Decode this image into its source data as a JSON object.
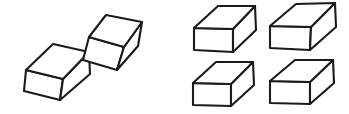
{
  "figure": {
    "background_color": "#ffffff",
    "line_color": "#1a1a1a",
    "face_fill_color": "#ffffff",
    "line_width": 2.1,
    "canvas": {
      "width": 349,
      "height": 114
    },
    "groups": [
      {
        "name": "left-group",
        "label": "Left group",
        "cube_count": 2,
        "arrangement": "diagonal-tilted",
        "cubes": [
          {
            "name": "left-group-cube-upper-right",
            "label": "Upper right tilted cube",
            "top_face": "89,37 106,15 142,22 124,47",
            "left_face": "89,37 124,47 117,70 83,60",
            "right_face": "124,47 142,22 138,46 117,70"
          },
          {
            "name": "left-group-cube-lower-left",
            "label": "Lower left tilted cube",
            "top_face": "26,70 53,44 89,52 63,79",
            "left_face": "26,70 63,79 60,100 24,91",
            "right_face": "63,79 89,52 90,74 60,100"
          }
        ]
      },
      {
        "name": "right-group",
        "label": "Right group",
        "cube_count": 4,
        "arrangement": "two-by-two-grid",
        "cubes": [
          {
            "name": "right-group-cube-top-left",
            "label": "Top left upright cube",
            "top_face": "194,28 218,6 255,6 233,29",
            "left_face": "194,28 233,29 233,52 194,50",
            "right_face": "233,29 255,6 256,30 233,52"
          },
          {
            "name": "right-group-cube-top-right",
            "label": "Top right upright cube",
            "top_face": "270,26 296,4 335,3 311,27",
            "left_face": "270,26 311,27 310,50 270,48",
            "right_face": "311,27 335,3 336,27 310,50"
          },
          {
            "name": "right-group-cube-bottom-left",
            "label": "Bottom left upright cube",
            "top_face": "193,83 216,62 253,62 231,84",
            "left_face": "193,83 231,84 231,106 193,105",
            "right_face": "231,84 253,62 254,85 231,106"
          },
          {
            "name": "right-group-cube-bottom-right",
            "label": "Bottom right upright cube",
            "top_face": "270,81 295,60 333,60 310,82",
            "left_face": "270,81 310,82 310,104 270,103",
            "right_face": "310,82 333,60 334,83 310,104"
          }
        ]
      }
    ]
  }
}
